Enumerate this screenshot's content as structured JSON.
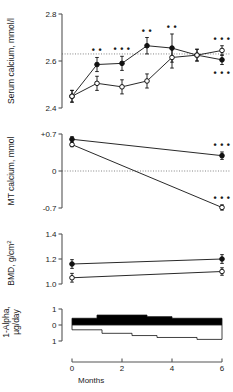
{
  "figure": {
    "xlabel": "Months",
    "x_ticks": [
      "0",
      "2",
      "4",
      "6"
    ],
    "x_values": [
      0,
      2,
      4,
      6
    ],
    "significance_symbol": "•"
  },
  "panels": [
    {
      "id": "serum-calcium",
      "ylabel": "Serum calcium, mmol/l",
      "y_ticks": [
        "2.4",
        "2.6",
        "2.8"
      ],
      "y_tick_values": [
        2.4,
        2.6,
        2.8
      ],
      "reference_line": 2.63
    },
    {
      "id": "mt-calcium",
      "ylabel": "MT calcium, mmol",
      "y_ticks": [
        "+0.7",
        "0",
        "-0.7"
      ],
      "y_tick_values": [
        0.7,
        0,
        -0.7
      ],
      "reference_line": 0
    },
    {
      "id": "bmd",
      "ylabel": "BMD, g/cm",
      "ylabel_sup": "2",
      "y_ticks": [
        "1.0",
        "1.2",
        "1.4"
      ],
      "y_tick_values": [
        1.0,
        1.2,
        1.4
      ]
    },
    {
      "id": "one-alpha-dose",
      "ylabel_line1": "1-Alpha,",
      "ylabel_line2": "µg/day",
      "y_ticks": [
        "1",
        "0",
        "1"
      ],
      "y_tick_values": [
        1,
        0,
        -1
      ]
    }
  ],
  "chart_data": [
    {
      "type": "line",
      "id": "serum-calcium",
      "title": "Serum calcium",
      "xlabel": "Months",
      "ylabel": "Serum calcium, mmol/l",
      "ylim": [
        2.4,
        2.8
      ],
      "xlim": [
        0,
        6
      ],
      "grid": false,
      "reference_line": 2.63,
      "x": [
        0,
        1,
        2,
        3,
        4,
        5,
        6
      ],
      "series": [
        {
          "name": "closed-circle",
          "marker": "filled",
          "values": [
            2.45,
            2.585,
            2.59,
            2.665,
            2.655,
            2.625,
            2.605
          ],
          "errors": [
            0.025,
            0.03,
            0.03,
            0.035,
            0.06,
            0.025,
            0.02
          ],
          "significance": [
            "",
            "**",
            "***",
            "**",
            "**",
            "",
            "***"
          ]
        },
        {
          "name": "open-circle",
          "marker": "open",
          "values": [
            2.45,
            2.505,
            2.49,
            2.515,
            2.615,
            2.625,
            2.645
          ],
          "errors": [
            0.025,
            0.03,
            0.03,
            0.03,
            0.045,
            0.025,
            0.02
          ],
          "significance": [
            "",
            "",
            "",
            "",
            "",
            "",
            "***"
          ]
        }
      ]
    },
    {
      "type": "line",
      "id": "mt-calcium",
      "title": "MT calcium",
      "xlabel": "Months",
      "ylabel": "MT calcium, mmol",
      "ylim": [
        -0.7,
        0.7
      ],
      "xlim": [
        0,
        6
      ],
      "grid": false,
      "reference_line": 0,
      "x": [
        0,
        6
      ],
      "series": [
        {
          "name": "closed-circle",
          "marker": "filled",
          "values": [
            0.6,
            0.29
          ],
          "errors": [
            0.05,
            0.07
          ],
          "significance": [
            "",
            "***"
          ]
        },
        {
          "name": "open-circle",
          "marker": "open",
          "values": [
            0.5,
            -0.69
          ],
          "errors": [
            0.04,
            0.05
          ],
          "significance": [
            "",
            "***"
          ]
        }
      ]
    },
    {
      "type": "line",
      "id": "bmd",
      "title": "BMD",
      "xlabel": "Months",
      "ylabel": "BMD, g/cm2",
      "ylim": [
        1.0,
        1.4
      ],
      "xlim": [
        0,
        6
      ],
      "grid": false,
      "x": [
        0,
        6
      ],
      "series": [
        {
          "name": "closed-circle",
          "marker": "filled",
          "values": [
            1.16,
            1.2
          ],
          "errors": [
            0.035,
            0.035
          ],
          "significance": [
            "",
            ""
          ]
        },
        {
          "name": "open-circle",
          "marker": "open",
          "values": [
            1.05,
            1.1
          ],
          "errors": [
            0.035,
            0.03
          ],
          "significance": [
            "",
            ""
          ]
        }
      ]
    },
    {
      "type": "area",
      "id": "one-alpha-dose",
      "title": "1-Alpha dose",
      "xlabel": "Months",
      "ylabel": "1-Alpha, µg/day",
      "ylim": [
        -1,
        1
      ],
      "xlim": [
        0,
        6
      ],
      "grid": false,
      "series": [
        {
          "name": "closed-group-dose",
          "fill": "#000000",
          "direction": "up",
          "steps": [
            {
              "x0": 0,
              "x1": 1,
              "value": 0.42
            },
            {
              "x0": 1,
              "x1": 3,
              "value": 0.62
            },
            {
              "x0": 3,
              "x1": 4,
              "value": 0.52
            },
            {
              "x0": 4,
              "x1": 6,
              "value": 0.42
            }
          ]
        },
        {
          "name": "open-group-dose",
          "fill": "#ffffff",
          "direction": "down",
          "steps": [
            {
              "x0": 0,
              "x1": 1.2,
              "value": 0.3
            },
            {
              "x0": 1.2,
              "x1": 2.4,
              "value": 0.52
            },
            {
              "x0": 2.4,
              "x1": 3.4,
              "value": 0.66
            },
            {
              "x0": 3.4,
              "x1": 5.0,
              "value": 0.78
            },
            {
              "x0": 5.0,
              "x1": 6,
              "value": 0.9
            }
          ]
        }
      ]
    }
  ]
}
